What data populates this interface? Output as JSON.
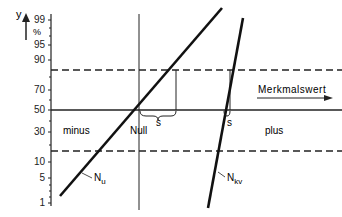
{
  "diagram": {
    "y_axis": {
      "label": "y",
      "unit": "%",
      "ticks": [
        "99",
        "95",
        "90",
        "70",
        "50",
        "30",
        "10",
        "5",
        "1"
      ]
    },
    "x_axis_label": "Merkmalswert",
    "regions": {
      "left": "minus",
      "center": "Null",
      "right": "plus"
    },
    "lines": {
      "nu": "N",
      "nu_sub": "u",
      "nkv": "N",
      "nkv_sub": "kv"
    },
    "s_labels": [
      "s",
      "s"
    ]
  }
}
